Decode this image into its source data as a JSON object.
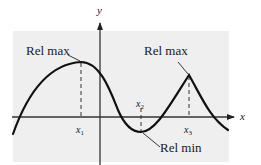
{
  "figure": {
    "type": "function graph with relative extrema",
    "colors": {
      "panel": "#efefef",
      "curve": "#111111",
      "axis": "#333333",
      "background": "#ffffff"
    },
    "axes": {
      "x_label": "x",
      "y_label": "y"
    },
    "annotations": [
      {
        "id": "rel-max-1",
        "label": "Rel max",
        "at": "x1"
      },
      {
        "id": "rel-min",
        "label": "Rel min",
        "at": "x2"
      },
      {
        "id": "rel-max-2",
        "label": "Rel max",
        "at": "x3"
      }
    ],
    "tick_labels": {
      "x1": {
        "base": "x",
        "sub": "1"
      },
      "x2": {
        "base": "x",
        "sub": "2"
      },
      "x3": {
        "base": "x",
        "sub": "3"
      }
    }
  }
}
